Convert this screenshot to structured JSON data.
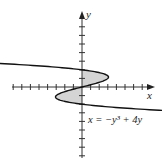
{
  "chart_data": {
    "type": "line",
    "title": "",
    "xlabel": "x",
    "ylabel": "y",
    "equation_label": "x = −y³ + 4y",
    "function": "x = -y^3 + 4y",
    "xlim": [
      -9,
      9
    ],
    "ylim": [
      -9,
      9
    ],
    "x_tick_step": 1,
    "y_tick_step": 1,
    "grid": false,
    "shaded_region": {
      "description": "region between curve x = -y^3 + 4y and the y-axis",
      "y_intervals": [
        [
          -2,
          0
        ],
        [
          0,
          2
        ]
      ]
    },
    "curve_y_range": [
      -3.3,
      3.3
    ],
    "colors": {
      "curve": "#111111",
      "axes": "#333333",
      "shade": "#d4d4d4"
    }
  }
}
